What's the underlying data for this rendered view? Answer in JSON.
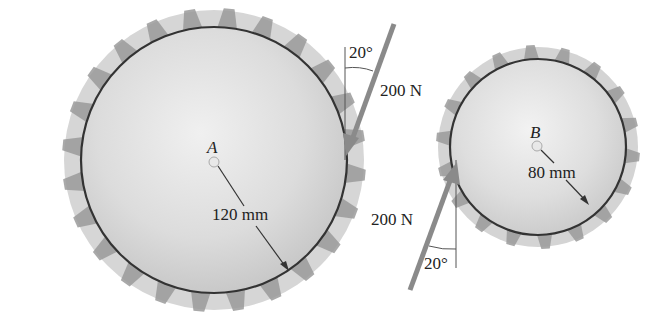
{
  "figure": {
    "gear_a": {
      "label": "A",
      "radius_label": "120 mm",
      "center": [
        214,
        160
      ],
      "pitch_radius_px": 133,
      "teeth": 24
    },
    "gear_b": {
      "label": "B",
      "radius_label": "80 mm",
      "center": [
        538,
        147
      ],
      "pitch_radius_px": 88,
      "teeth": 18
    },
    "force_top": {
      "magnitude_label": "200 N",
      "angle_label": "20°"
    },
    "force_bottom": {
      "magnitude_label": "200 N",
      "angle_label": "20°"
    },
    "colors": {
      "gear_face": "#d9d9d9",
      "gear_teeth": "#9a9a9a",
      "pitch_circle": "#333333",
      "force_arrow": "#8a8a8a",
      "text": "#222222"
    }
  }
}
